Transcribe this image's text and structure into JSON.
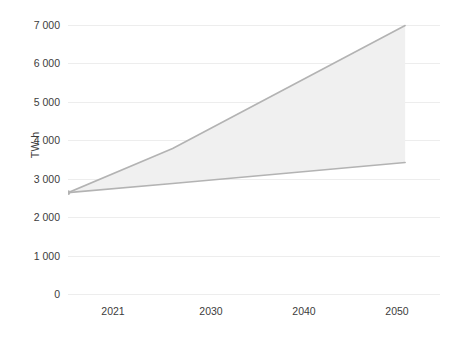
{
  "chart_data": {
    "type": "area",
    "title": "",
    "subtitle": "",
    "xlabel": "",
    "ylabel": "TW·h",
    "x": [
      2021,
      2030,
      2040,
      2050
    ],
    "xlim": [
      2021,
      2053
    ],
    "ylim": [
      0,
      7000
    ],
    "grid": true,
    "legend": false,
    "legend_position": "none",
    "x_tick_labels": [
      "2021",
      "2030",
      "2040",
      "2050"
    ],
    "y_tick_labels": [
      "0",
      "1 000",
      "2 000",
      "3 000",
      "4 000",
      "5 000",
      "6 000",
      "7 000"
    ],
    "y_ticks": [
      0,
      1000,
      2000,
      3000,
      4000,
      5000,
      6000,
      7000
    ],
    "series": [
      {
        "name": "High scenario",
        "values": [
          2650,
          3800,
          5400,
          7000
        ]
      },
      {
        "name": "Low scenario",
        "values": [
          2650,
          2890,
          3160,
          3435
        ]
      }
    ],
    "band": {
      "name": "Projection range",
      "x": [
        2021,
        2030,
        2040,
        2050
      ],
      "upper": [
        2650,
        3800,
        5400,
        7000
      ],
      "lower": [
        2650,
        2890,
        3160,
        3435
      ]
    },
    "annotations": [],
    "colors": {
      "line": "#b3b3b3",
      "fill": "#f0f0f0",
      "grid": "#ededed",
      "text": "#3c3c3c",
      "background": "#ffffff"
    }
  }
}
